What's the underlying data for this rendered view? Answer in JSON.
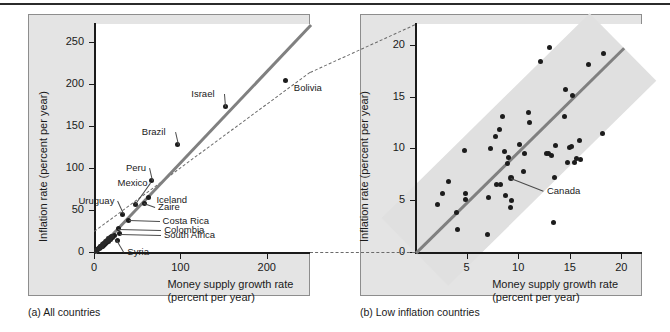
{
  "figure": {
    "panel_a_caption": "(a) All countries",
    "panel_b_caption": "(b) Low inflation countries"
  },
  "chart_data": [
    {
      "type": "scatter",
      "panel": "a",
      "title": "All countries",
      "xlabel": "Money supply growth rate",
      "xlabel_units": "(percent per year)",
      "ylabel": "Inflation rate",
      "ylabel_units": "(percent per year)",
      "xlim": [
        0,
        250
      ],
      "ylim": [
        0,
        272
      ],
      "xticks": [
        0,
        100,
        200
      ],
      "yticks": [
        0,
        50,
        100,
        150,
        200,
        250
      ],
      "grid": false,
      "legend": "none",
      "trendline": {
        "style": "solid",
        "color": "#808080",
        "x0": 0,
        "y0": 0,
        "x1": 250,
        "y1": 272
      },
      "reference_line": {
        "style": "dashed",
        "color": "#6a6a6a",
        "x0": 0,
        "y0": 25,
        "x1": 250,
        "y1": 215
      },
      "points": [
        {
          "label": "Bolivia",
          "x": 222,
          "y": 205,
          "label_dx": 8,
          "label_dy": 8
        },
        {
          "label": "Israel",
          "x": 152,
          "y": 173,
          "label_dx": -34,
          "label_dy": -13
        },
        {
          "label": "Brazil",
          "x": 97,
          "y": 128,
          "label_dx": -36,
          "label_dy": -13
        },
        {
          "label": "Peru",
          "x": 67,
          "y": 85,
          "label_dx": -26,
          "label_dy": -13
        },
        {
          "label": "Iceland",
          "x": 63,
          "y": 65,
          "label_dx": 8,
          "label_dy": 2
        },
        {
          "label": "Zaire",
          "x": 58,
          "y": 58,
          "label_dx": 14,
          "label_dy": 4
        },
        {
          "label": "Mexico",
          "x": 48,
          "y": 57,
          "label_dx": -18,
          "label_dy": -21
        },
        {
          "label": "Costa Rica",
          "x": 40,
          "y": 38,
          "label_dx": 34,
          "label_dy": 1
        },
        {
          "label": "Uruguay",
          "x": 33,
          "y": 45,
          "label_dx": -44,
          "label_dy": -13
        },
        {
          "label": "Colombia",
          "x": 28,
          "y": 28,
          "label_dx": 46,
          "label_dy": 1
        },
        {
          "label": "South Africa",
          "x": 30,
          "y": 22,
          "label_dx": 44,
          "label_dy": 1
        },
        {
          "label": "Syria",
          "x": 27,
          "y": 14,
          "label_dx": 10,
          "label_dy": 12
        },
        {
          "label": "",
          "x": 24,
          "y": 20
        },
        {
          "label": "",
          "x": 21,
          "y": 17
        },
        {
          "label": "",
          "x": 19,
          "y": 15
        },
        {
          "label": "",
          "x": 17,
          "y": 13
        },
        {
          "label": "",
          "x": 15,
          "y": 11
        },
        {
          "label": "",
          "x": 13,
          "y": 10
        },
        {
          "label": "",
          "x": 12,
          "y": 9
        },
        {
          "label": "",
          "x": 11,
          "y": 8
        },
        {
          "label": "",
          "x": 10,
          "y": 7
        },
        {
          "label": "",
          "x": 9,
          "y": 6
        },
        {
          "label": "",
          "x": 8,
          "y": 6
        },
        {
          "label": "",
          "x": 7,
          "y": 5
        },
        {
          "label": "",
          "x": 6,
          "y": 4
        },
        {
          "label": "",
          "x": 5,
          "y": 4
        },
        {
          "label": "",
          "x": 4,
          "y": 3
        },
        {
          "label": "",
          "x": 3,
          "y": 2
        }
      ]
    },
    {
      "type": "scatter",
      "panel": "b",
      "title": "Low inflation countries",
      "xlabel": "Money supply growth rate",
      "xlabel_units": "(percent per year)",
      "ylabel": "Inflation rate",
      "ylabel_units": "(percent per year)",
      "xlim": [
        0,
        22
      ],
      "ylim": [
        0,
        22
      ],
      "xticks": [
        5,
        10,
        15,
        20
      ],
      "yticks": [
        0,
        5,
        10,
        15,
        20
      ],
      "grid": false,
      "legend": "none",
      "trendline": {
        "style": "solid",
        "color": "#808080",
        "x0": 0,
        "y0": 0,
        "x1": 20.2,
        "y1": 19.8
      },
      "confidence_band": {
        "color": "#e0e0e0",
        "half_width_y": 4.6
      },
      "points": [
        {
          "label": "",
          "x": 2.2,
          "y": 4.6
        },
        {
          "label": "",
          "x": 2.7,
          "y": 5.6
        },
        {
          "label": "",
          "x": 3.2,
          "y": 6.8
        },
        {
          "label": "",
          "x": 4.0,
          "y": 3.8
        },
        {
          "label": "",
          "x": 4.1,
          "y": 2.2
        },
        {
          "label": "",
          "x": 4.8,
          "y": 9.8
        },
        {
          "label": "",
          "x": 4.9,
          "y": 5.6
        },
        {
          "label": "",
          "x": 4.9,
          "y": 5.1
        },
        {
          "label": "",
          "x": 7.0,
          "y": 1.7
        },
        {
          "label": "",
          "x": 7.1,
          "y": 5.3
        },
        {
          "label": "",
          "x": 7.3,
          "y": 10.0
        },
        {
          "label": "",
          "x": 7.8,
          "y": 11.1
        },
        {
          "label": "",
          "x": 7.9,
          "y": 6.5
        },
        {
          "label": "",
          "x": 8.2,
          "y": 11.8
        },
        {
          "label": "",
          "x": 8.3,
          "y": 6.5
        },
        {
          "label": "",
          "x": 8.5,
          "y": 13.1
        },
        {
          "label": "",
          "x": 8.7,
          "y": 9.7
        },
        {
          "label": "",
          "x": 8.8,
          "y": 5.5
        },
        {
          "label": "",
          "x": 9.0,
          "y": 8.5
        },
        {
          "label": "",
          "x": 9.1,
          "y": 9.1
        },
        {
          "label": "",
          "x": 9.3,
          "y": 4.3
        },
        {
          "label": "",
          "x": 9.4,
          "y": 5.0
        },
        {
          "label": "Canada",
          "x": 9.3,
          "y": 7.1,
          "highlight": true,
          "label_dx": 36,
          "label_dy": 13
        },
        {
          "label": "",
          "x": 10.1,
          "y": 10.4
        },
        {
          "label": "",
          "x": 10.5,
          "y": 7.8
        },
        {
          "label": "",
          "x": 10.6,
          "y": 9.5
        },
        {
          "label": "",
          "x": 11.0,
          "y": 13.5
        },
        {
          "label": "",
          "x": 11.1,
          "y": 12.5
        },
        {
          "label": "",
          "x": 12.2,
          "y": 18.4
        },
        {
          "label": "",
          "x": 12.7,
          "y": 9.5
        },
        {
          "label": "",
          "x": 12.9,
          "y": 9.5
        },
        {
          "label": "",
          "x": 13.0,
          "y": 19.7
        },
        {
          "label": "",
          "x": 13.2,
          "y": 9.3
        },
        {
          "label": "",
          "x": 13.4,
          "y": 2.8
        },
        {
          "label": "",
          "x": 13.5,
          "y": 7.2
        },
        {
          "label": "",
          "x": 13.6,
          "y": 10.3
        },
        {
          "label": "",
          "x": 14.5,
          "y": 13.1
        },
        {
          "label": "",
          "x": 14.6,
          "y": 15.7
        },
        {
          "label": "",
          "x": 14.8,
          "y": 8.6
        },
        {
          "label": "",
          "x": 15.0,
          "y": 10.1
        },
        {
          "label": "",
          "x": 15.2,
          "y": 10.2
        },
        {
          "label": "",
          "x": 15.3,
          "y": 15.1
        },
        {
          "label": "",
          "x": 15.5,
          "y": 8.6
        },
        {
          "label": "",
          "x": 15.7,
          "y": 9.0
        },
        {
          "label": "",
          "x": 15.9,
          "y": 10.8
        },
        {
          "label": "",
          "x": 16.0,
          "y": 8.9
        },
        {
          "label": "",
          "x": 16.8,
          "y": 18.1
        },
        {
          "label": "",
          "x": 18.2,
          "y": 11.4
        },
        {
          "label": "",
          "x": 18.3,
          "y": 19.2
        }
      ]
    }
  ],
  "connectors": {
    "top_note": "dashed line linking panel (a) reference line to panel (b) top-left",
    "bottom_note": "dashed line linking panel (a) x-axis origin region to panel (b) origin"
  }
}
